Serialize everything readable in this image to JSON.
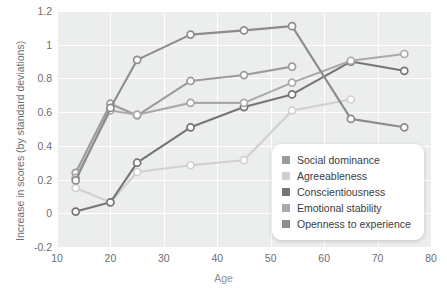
{
  "chart_data": {
    "type": "line",
    "title": "",
    "xlabel": "Age",
    "ylabel": "Increase in scores (by standard deviations)",
    "xlim": [
      10,
      80
    ],
    "ylim": [
      -0.2,
      1.2
    ],
    "xticks": [
      "10",
      "20",
      "30",
      "40",
      "50",
      "60",
      "70",
      "80"
    ],
    "yticks": [
      "1.2",
      "1",
      "0.8",
      "0.6",
      "0.4",
      "0.2",
      "0",
      "-0.2"
    ],
    "grid": true,
    "legend_position": "inside lower-right",
    "marker": "open-circle",
    "series": [
      {
        "name": "Social dominance",
        "color": "#9a9b9d",
        "x": [
          13.5,
          20,
          25,
          35,
          45,
          54
        ],
        "values": [
          0.24,
          0.65,
          0.58,
          0.785,
          0.82,
          0.87
        ]
      },
      {
        "name": "Agreeableness",
        "color": "#cfd0d1",
        "x": [
          13.5,
          20,
          25,
          35,
          45,
          54,
          65
        ],
        "values": [
          0.15,
          0.065,
          0.245,
          0.285,
          0.315,
          0.61,
          0.675
        ]
      },
      {
        "name": "Conscientiousness",
        "color": "#747578",
        "x": [
          13.5,
          20,
          25,
          35,
          45,
          54,
          65,
          75
        ],
        "values": [
          0.01,
          0.065,
          0.3,
          0.51,
          0.63,
          0.705,
          0.9,
          0.845
        ]
      },
      {
        "name": "Emotional stability",
        "color": "#a8a9ab",
        "x": [
          13.5,
          20,
          25,
          35,
          45,
          54,
          65,
          75
        ],
        "values": [
          0.21,
          0.61,
          0.585,
          0.655,
          0.655,
          0.775,
          0.905,
          0.945
        ]
      },
      {
        "name": "Openness to experience",
        "color": "#8b8c8e",
        "x": [
          13.5,
          20,
          25,
          35,
          45,
          54,
          65,
          75
        ],
        "values": [
          0.195,
          0.625,
          0.91,
          1.06,
          1.085,
          1.11,
          0.56,
          0.51
        ]
      }
    ]
  },
  "legend": {
    "items": [
      {
        "label": "Social dominance",
        "color": "#9a9b9d"
      },
      {
        "label": "Agreeableness",
        "color": "#cfd0d1"
      },
      {
        "label": "Conscientiousness",
        "color": "#747578"
      },
      {
        "label": "Emotional stability",
        "color": "#a8a9ab"
      },
      {
        "label": "Openness to experience",
        "color": "#8b8c8e"
      }
    ]
  }
}
